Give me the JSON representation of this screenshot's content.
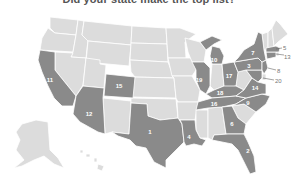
{
  "title": "Did your state make the top list?",
  "colors": {
    "highlight": "#8a8a8a",
    "base": "#dcdcdc",
    "border": "#ffffff",
    "label": "#ffffff",
    "callout": "#777777"
  },
  "ranked_states": [
    {
      "rank": "1",
      "state": "Texas"
    },
    {
      "rank": "2",
      "state": "Florida"
    },
    {
      "rank": "3",
      "state": "Pennsylvania"
    },
    {
      "rank": "4",
      "state": "Louisiana"
    },
    {
      "rank": "5",
      "state": "Massachusetts"
    },
    {
      "rank": "6",
      "state": "Georgia"
    },
    {
      "rank": "7",
      "state": "New York"
    },
    {
      "rank": "8",
      "state": "New Jersey"
    },
    {
      "rank": "9",
      "state": "North Carolina"
    },
    {
      "rank": "10",
      "state": "Michigan"
    },
    {
      "rank": "11",
      "state": "California"
    },
    {
      "rank": "12",
      "state": "Arizona"
    },
    {
      "rank": "13",
      "state": "Connecticut"
    },
    {
      "rank": "14",
      "state": "Virginia"
    },
    {
      "rank": "15",
      "state": "Colorado"
    },
    {
      "rank": "16",
      "state": "Tennessee"
    },
    {
      "rank": "17",
      "state": "Ohio"
    },
    {
      "rank": "18",
      "state": "Kentucky"
    },
    {
      "rank": "19",
      "state": "Illinois"
    },
    {
      "rank": "20",
      "state": "Maryland"
    }
  ],
  "labels": {
    "tx": "1",
    "fl": "2",
    "pa": "3",
    "la": "4",
    "ma": "5",
    "ga": "6",
    "ny": "7",
    "nj": "8",
    "nc": "9",
    "mi": "10",
    "ca": "11",
    "az": "12",
    "ct": "13",
    "va": "14",
    "co": "15",
    "tn": "16",
    "oh": "17",
    "ky": "18",
    "il": "19",
    "md": "20"
  }
}
